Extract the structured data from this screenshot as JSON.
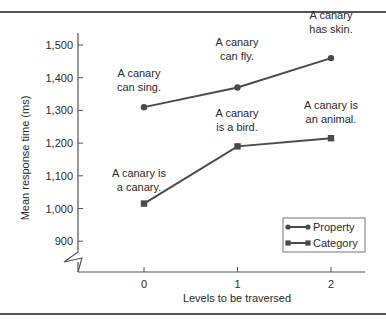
{
  "chart_data": {
    "type": "line",
    "title": "",
    "xlabel": "Levels to be traversed",
    "ylabel": "Mean response time (ms)",
    "x": [
      0,
      1,
      2
    ],
    "x_tick_labels": [
      "0",
      "1",
      "2"
    ],
    "y_ticks": [
      900,
      1000,
      1100,
      1200,
      1300,
      1400,
      1500
    ],
    "y_tick_labels": [
      "900",
      "1,000",
      "1,100",
      "1,200",
      "1,300",
      "1,400",
      "1,500"
    ],
    "ylim": [
      860,
      1530
    ],
    "y_axis_break": true,
    "grid": false,
    "legend_position": "lower right",
    "series": [
      {
        "name": "Property",
        "marker": "circle",
        "values": [
          1310,
          1370,
          1460
        ],
        "annotations": [
          "A canary\ncan sing.",
          "A canary\ncan fly.",
          "A canary\nhas skin."
        ]
      },
      {
        "name": "Category",
        "marker": "square",
        "values": [
          1015,
          1190,
          1215
        ],
        "annotations": [
          "A canary is\na canary.",
          "A canary\nis a bird.",
          "A canary is\nan animal."
        ]
      }
    ],
    "colors": {
      "line": "#4a4a4a",
      "axis": "#555555",
      "text": "#2b2b2b"
    }
  }
}
